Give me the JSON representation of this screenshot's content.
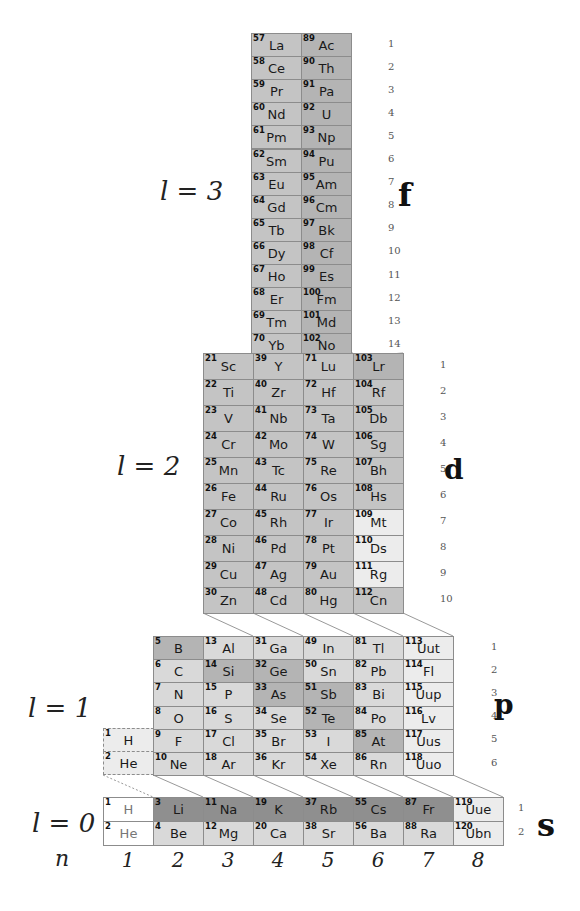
{
  "colors": {
    "dark": "#8f8f8f",
    "mid": "#b4b4b4",
    "midlight": "#c4c4c4",
    "light": "#d9d9d9",
    "pale": "#ececec",
    "white": "#ffffff",
    "border": "#8c8c8c"
  },
  "labels": {
    "l3": "l = 3",
    "l2": "l = 2",
    "l1": "l = 1",
    "l0": "l = 0",
    "n": "n",
    "f": "f",
    "d": "d",
    "p": "p",
    "s": "s",
    "n_values": [
      "1",
      "2",
      "3",
      "4",
      "5",
      "6",
      "7",
      "8"
    ]
  },
  "blocks": {
    "f": {
      "rows": [
        "1",
        "2",
        "3",
        "4",
        "5",
        "6",
        "7",
        "8",
        "9",
        "10",
        "11",
        "12",
        "13",
        "14"
      ],
      "columns": [
        [
          [
            "57",
            "La"
          ],
          [
            "58",
            "Ce"
          ],
          [
            "59",
            "Pr"
          ],
          [
            "60",
            "Nd"
          ],
          [
            "61",
            "Pm"
          ],
          [
            "62",
            "Sm"
          ],
          [
            "63",
            "Eu"
          ],
          [
            "64",
            "Gd"
          ],
          [
            "65",
            "Tb"
          ],
          [
            "66",
            "Dy"
          ],
          [
            "67",
            "Ho"
          ],
          [
            "68",
            "Er"
          ],
          [
            "69",
            "Tm"
          ],
          [
            "70",
            "Yb"
          ]
        ],
        [
          [
            "89",
            "Ac"
          ],
          [
            "90",
            "Th"
          ],
          [
            "91",
            "Pa"
          ],
          [
            "92",
            "U"
          ],
          [
            "93",
            "Np"
          ],
          [
            "94",
            "Pu"
          ],
          [
            "95",
            "Am"
          ],
          [
            "96",
            "Cm"
          ],
          [
            "97",
            "Bk"
          ],
          [
            "98",
            "Cf"
          ],
          [
            "99",
            "Es"
          ],
          [
            "100",
            "Fm"
          ],
          [
            "101",
            "Md"
          ],
          [
            "102",
            "No"
          ]
        ]
      ]
    },
    "d": {
      "rows": [
        "1",
        "2",
        "3",
        "4",
        "5",
        "6",
        "7",
        "8",
        "9",
        "10"
      ],
      "columns": [
        [
          [
            "21",
            "Sc"
          ],
          [
            "22",
            "Ti"
          ],
          [
            "23",
            "V"
          ],
          [
            "24",
            "Cr"
          ],
          [
            "25",
            "Mn"
          ],
          [
            "26",
            "Fe"
          ],
          [
            "27",
            "Co"
          ],
          [
            "28",
            "Ni"
          ],
          [
            "29",
            "Cu"
          ],
          [
            "30",
            "Zn"
          ]
        ],
        [
          [
            "39",
            "Y"
          ],
          [
            "40",
            "Zr"
          ],
          [
            "41",
            "Nb"
          ],
          [
            "42",
            "Mo"
          ],
          [
            "43",
            "Tc"
          ],
          [
            "44",
            "Ru"
          ],
          [
            "45",
            "Rh"
          ],
          [
            "46",
            "Pd"
          ],
          [
            "47",
            "Ag"
          ],
          [
            "48",
            "Cd"
          ]
        ],
        [
          [
            "71",
            "Lu"
          ],
          [
            "72",
            "Hf"
          ],
          [
            "73",
            "Ta"
          ],
          [
            "74",
            "W"
          ],
          [
            "75",
            "Re"
          ],
          [
            "76",
            "Os"
          ],
          [
            "77",
            "Ir"
          ],
          [
            "78",
            "Pt"
          ],
          [
            "79",
            "Au"
          ],
          [
            "80",
            "Hg"
          ]
        ],
        [
          [
            "103",
            "Lr"
          ],
          [
            "104",
            "Rf"
          ],
          [
            "105",
            "Db"
          ],
          [
            "106",
            "Sg"
          ],
          [
            "107",
            "Bh"
          ],
          [
            "108",
            "Hs"
          ],
          [
            "109",
            "Mt"
          ],
          [
            "110",
            "Ds"
          ],
          [
            "111",
            "Rg"
          ],
          [
            "112",
            "Cn"
          ]
        ]
      ]
    },
    "p": {
      "rows": [
        "1",
        "2",
        "3",
        "4",
        "5",
        "6"
      ],
      "helium_column": [
        [
          "1",
          "H"
        ],
        [
          "2",
          "He"
        ]
      ],
      "columns": [
        [
          [
            "5",
            "B"
          ],
          [
            "6",
            "C"
          ],
          [
            "7",
            "N"
          ],
          [
            "8",
            "O"
          ],
          [
            "9",
            "F"
          ],
          [
            "10",
            "Ne"
          ]
        ],
        [
          [
            "13",
            "Al"
          ],
          [
            "14",
            "Si"
          ],
          [
            "15",
            "P"
          ],
          [
            "16",
            "S"
          ],
          [
            "17",
            "Cl"
          ],
          [
            "18",
            "Ar"
          ]
        ],
        [
          [
            "31",
            "Ga"
          ],
          [
            "32",
            "Ge"
          ],
          [
            "33",
            "As"
          ],
          [
            "34",
            "Se"
          ],
          [
            "35",
            "Br"
          ],
          [
            "36",
            "Kr"
          ]
        ],
        [
          [
            "49",
            "In"
          ],
          [
            "50",
            "Sn"
          ],
          [
            "51",
            "Sb"
          ],
          [
            "52",
            "Te"
          ],
          [
            "53",
            "I"
          ],
          [
            "54",
            "Xe"
          ]
        ],
        [
          [
            "81",
            "Tl"
          ],
          [
            "82",
            "Pb"
          ],
          [
            "83",
            "Bi"
          ],
          [
            "84",
            "Po"
          ],
          [
            "85",
            "At"
          ],
          [
            "86",
            "Rn"
          ]
        ],
        [
          [
            "113",
            "Uut"
          ],
          [
            "114",
            "Fl"
          ],
          [
            "115",
            "Uup"
          ],
          [
            "116",
            "Lv"
          ],
          [
            "117",
            "Uus"
          ],
          [
            "118",
            "Uuo"
          ]
        ]
      ]
    },
    "s": {
      "rows": [
        "1",
        "2"
      ],
      "columns": [
        [
          [
            "1",
            "H"
          ],
          [
            "2",
            "He"
          ]
        ],
        [
          [
            "3",
            "Li"
          ],
          [
            "4",
            "Be"
          ]
        ],
        [
          [
            "11",
            "Na"
          ],
          [
            "12",
            "Mg"
          ]
        ],
        [
          [
            "19",
            "K"
          ],
          [
            "20",
            "Ca"
          ]
        ],
        [
          [
            "37",
            "Rb"
          ],
          [
            "38",
            "Sr"
          ]
        ],
        [
          [
            "55",
            "Cs"
          ],
          [
            "56",
            "Ba"
          ]
        ],
        [
          [
            "87",
            "Fr"
          ],
          [
            "88",
            "Ra"
          ]
        ],
        [
          [
            "119",
            "Uue"
          ],
          [
            "120",
            "Ubn"
          ]
        ]
      ]
    }
  }
}
